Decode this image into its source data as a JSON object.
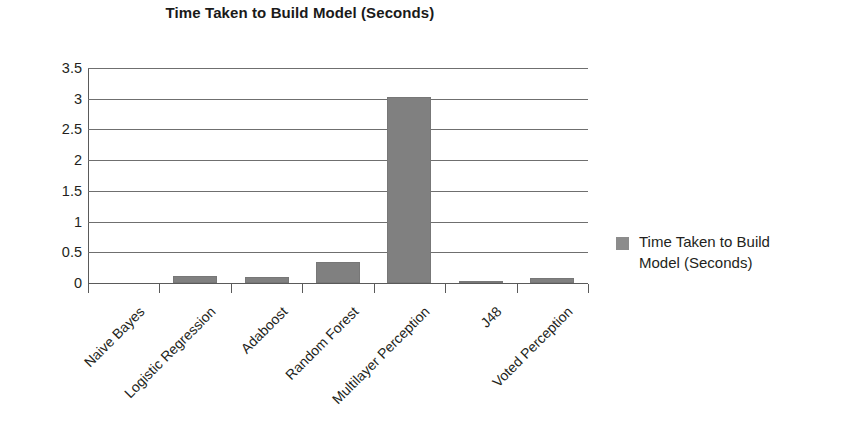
{
  "chart_data": {
    "type": "bar",
    "title": "Time Taken to Build Model (Seconds)",
    "xlabel": "",
    "ylabel": "",
    "categories": [
      "Naive Bayes",
      "Logistic Regression",
      "Adaboost",
      "Random Forest",
      "Multilayer Perception",
      "J48",
      "Voted Perception"
    ],
    "series": [
      {
        "name": "Time Taken to Build Model (Seconds)",
        "values": [
          0,
          0.11,
          0.1,
          0.34,
          3.03,
          0.04,
          0.08
        ]
      }
    ],
    "ylim": [
      0,
      3.5
    ],
    "ytick_values": [
      0,
      0.5,
      1,
      1.5,
      2,
      2.5,
      3,
      3.5
    ],
    "ytick_labels": [
      "0",
      "0.5",
      "1",
      "1.5",
      "2",
      "2.5",
      "3",
      "3.5"
    ],
    "grid": true,
    "legend_position": "right",
    "legend_entries": [
      "Time Taken to Build Model (Seconds)"
    ],
    "bar_color": "#808080",
    "legend_swatch_color": "#8c8c8c",
    "axis_color": "#5a5a5a",
    "gridline_color": "#6f6f6f",
    "text_color": "#231f20",
    "xtick_label_rotation": -45
  },
  "legend": {
    "line1": "Time Taken to Build",
    "line2": "Model (Seconds)"
  }
}
